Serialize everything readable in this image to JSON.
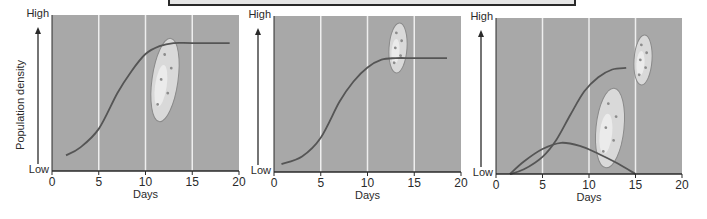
{
  "y_axis_label": "Population density",
  "colors": {
    "plot_bg": "#a8a8a8",
    "gridline": "#eeeeee",
    "curve": "#555555",
    "axis": "#2a2a2a",
    "organism_fill": "#d9d9d9",
    "organism_edge": "#8a8a8a"
  },
  "chart_data": [
    {
      "type": "line",
      "title": "",
      "xlabel": "Days",
      "ylabel": "Population density",
      "x_ticks": [
        0,
        5,
        10,
        15,
        20
      ],
      "xlim": [
        0,
        20
      ],
      "y_tick_labels": {
        "low": "Low",
        "high": "High"
      },
      "ylim": [
        0,
        100
      ],
      "grid": "vertical at 5,10,15",
      "series": [
        {
          "name": "Species alone (logistic growth)",
          "x": [
            1.5,
            3,
            5,
            7,
            8.5,
            10,
            11.5,
            13,
            15,
            19
          ],
          "y": [
            10,
            15,
            27,
            50,
            64,
            75,
            80,
            82,
            82,
            82
          ]
        }
      ],
      "annotations": [
        "paramecium illustration near day 13"
      ]
    },
    {
      "type": "line",
      "title": "",
      "xlabel": "Days",
      "ylabel": "",
      "x_ticks": [
        0,
        5,
        10,
        15,
        20
      ],
      "xlim": [
        0,
        20
      ],
      "y_tick_labels": {
        "low": "Low",
        "high": "High"
      },
      "ylim": [
        0,
        100
      ],
      "grid": "vertical at 5,10,15",
      "series": [
        {
          "name": "Species alone (logistic growth)",
          "x": [
            0.8,
            3,
            5,
            7,
            8.5,
            10,
            11.5,
            13,
            15,
            18.5
          ],
          "y": [
            5,
            10,
            22,
            45,
            58,
            67,
            72,
            73,
            73,
            73
          ]
        }
      ],
      "annotations": [
        "paramecium illustration near day 13.5"
      ]
    },
    {
      "type": "line",
      "title": "",
      "xlabel": "Days",
      "ylabel": "",
      "x_ticks": [
        0,
        5,
        10,
        15,
        20
      ],
      "xlim": [
        0,
        20
      ],
      "y_tick_labels": {
        "low": "Low",
        "high": "High"
      },
      "ylim": [
        0,
        100
      ],
      "grid": "vertical at 5,10,15",
      "series": [
        {
          "name": "Competitive winner",
          "x": [
            1.5,
            3,
            5,
            6.5,
            8,
            9.5,
            11,
            12.5,
            14
          ],
          "y": [
            0,
            3,
            11,
            22,
            38,
            53,
            62,
            67,
            68
          ]
        },
        {
          "name": "Competitive loser",
          "x": [
            1.5,
            3,
            5,
            7,
            9,
            11,
            13,
            15
          ],
          "y": [
            0,
            8,
            16,
            20,
            18,
            13,
            7,
            0
          ]
        }
      ],
      "annotations": [
        "two paramecium illustrations near days 12 and 15.5"
      ]
    }
  ]
}
